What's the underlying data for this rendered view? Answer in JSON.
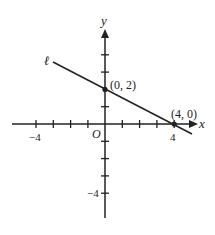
{
  "diagram": {
    "type": "coordinate-plane",
    "axes": {
      "x_label": "x",
      "y_label": "y",
      "origin_label": "O",
      "x_range": [
        -5,
        5
      ],
      "y_range": [
        -5,
        5
      ],
      "x_tick_labels": [
        {
          "value": -4,
          "label": "−4"
        },
        {
          "value": 4,
          "label": "4"
        }
      ],
      "y_tick_labels": [
        {
          "value": -4,
          "label": "−4"
        }
      ]
    },
    "line": {
      "name": "ℓ",
      "points": [
        {
          "x": 0,
          "y": 2,
          "label": "(0, 2)"
        },
        {
          "x": 4,
          "y": 0,
          "label": "(4, 0)"
        }
      ]
    },
    "colors": {
      "stroke": "#222222",
      "background": "#ffffff"
    }
  }
}
